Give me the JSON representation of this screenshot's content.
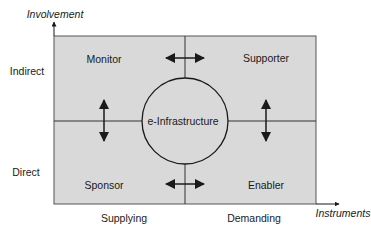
{
  "axes": {
    "y_title": "Involvement",
    "x_title": "Instruments",
    "y_levels": [
      "Indirect",
      "Direct"
    ],
    "x_levels": [
      "Supplying",
      "Demanding"
    ]
  },
  "quadrants": {
    "top_left": "Monitor",
    "top_right": "Supporter",
    "bottom_left": "Sponsor",
    "bottom_right": "Enabler"
  },
  "center": "e-Infrastructure",
  "colors": {
    "fill": "#d9d9d9",
    "stroke": "#1a1a1a"
  }
}
